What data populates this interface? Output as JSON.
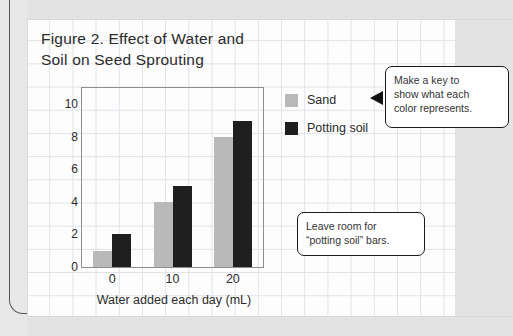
{
  "figure": {
    "title": "Figure 2. Effect of Water and\nSoil on Seed Sprouting"
  },
  "legend": {
    "items": [
      {
        "label": "Sand",
        "color": "#b9b9b9"
      },
      {
        "label": "Potting soil",
        "color": "#1f1f1f"
      }
    ]
  },
  "callouts": [
    {
      "name": "callout-make-a-key",
      "text": "Make a key to\nshow what each\ncolor represents."
    },
    {
      "name": "callout-leave-room",
      "text": "Leave room for\n“potting soil” bars."
    }
  ],
  "axes": {
    "y_ticks": [
      "0",
      "2",
      "4",
      "6",
      "8",
      "10"
    ],
    "x_ticks": [
      "0",
      "10",
      "20"
    ]
  },
  "chart_data": {
    "type": "bar",
    "title": "Figure 2. Effect of Water and Soil on Seed Sprouting",
    "xlabel": "Water added each day (mL)",
    "ylabel": "Number of sprouting seeds",
    "categories": [
      "0",
      "10",
      "20"
    ],
    "series": [
      {
        "name": "Sand",
        "color": "#b9b9b9",
        "values": [
          1,
          4,
          8
        ]
      },
      {
        "name": "Potting soil",
        "color": "#1f1f1f",
        "values": [
          2,
          5,
          9
        ]
      }
    ],
    "ylim": [
      0,
      11
    ],
    "ytick_values": [
      0,
      2,
      4,
      6,
      8,
      10
    ],
    "grid": true,
    "legend_position": "right"
  }
}
